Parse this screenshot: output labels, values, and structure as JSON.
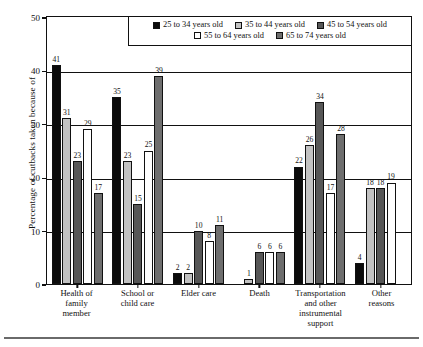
{
  "chart_data": {
    "type": "bar",
    "title": "",
    "xlabel": "",
    "ylabel": "Percentage of cutbacks taken because of",
    "ylim": [
      0,
      50
    ],
    "yticks": [
      0,
      10,
      20,
      30,
      40,
      50
    ],
    "grid": true,
    "legend_position": "top-center",
    "categories": [
      "Health of family member",
      "School or child care",
      "Elder care",
      "Death",
      "Transportation and other instrumental support",
      "Other reasons"
    ],
    "category_lines": [
      [
        "Health of",
        "family",
        "member"
      ],
      [
        "School or",
        "child care"
      ],
      [
        "Elder care"
      ],
      [
        "Death"
      ],
      [
        "Transportation",
        "and other",
        "instrumental",
        "support"
      ],
      [
        "Other",
        "reasons"
      ]
    ],
    "series": [
      {
        "name": "25 to 34 years old",
        "swatch": "black",
        "color": "#0b0b0b",
        "values": [
          41,
          35,
          2,
          0,
          22,
          4
        ],
        "labels": [
          "41",
          "35",
          "2",
          "",
          "22",
          "4"
        ]
      },
      {
        "name": "35 to 44 years old",
        "swatch": "light-gray",
        "color": "#c2c2c2",
        "values": [
          31,
          23,
          2,
          1,
          26,
          18
        ],
        "labels": [
          "31",
          "23",
          "2",
          "1",
          "26",
          "18"
        ]
      },
      {
        "name": "45 to 54 years old",
        "swatch": "dark-gray",
        "color": "#575757",
        "values": [
          23,
          15,
          10,
          6,
          34,
          18
        ],
        "labels": [
          "23",
          "15",
          "10",
          "6",
          "34",
          "18"
        ]
      },
      {
        "name": "55 to 64 years old",
        "swatch": "white",
        "color": "#ffffff",
        "values": [
          29,
          25,
          8,
          6,
          17,
          19
        ],
        "labels": [
          "29",
          "25",
          "8",
          "6",
          "17",
          "19"
        ]
      },
      {
        "name": "65 to 74 years old",
        "swatch": "medium-gray",
        "color": "#6e6e6e",
        "values": [
          17,
          39,
          11,
          6,
          28,
          0
        ],
        "labels": [
          "17",
          "39",
          "11",
          "6",
          "28",
          ""
        ]
      }
    ]
  }
}
